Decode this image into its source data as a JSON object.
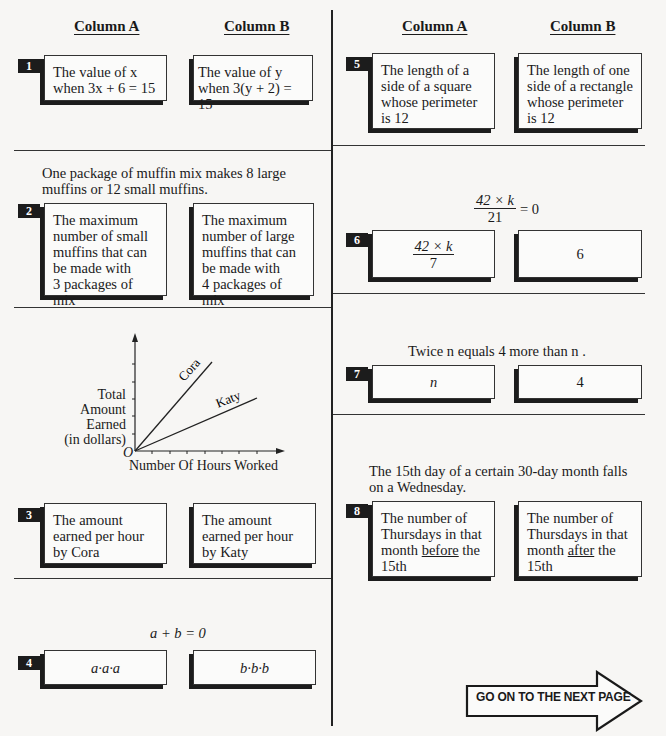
{
  "headers": {
    "left": {
      "column_a": "Column A",
      "column_b": "Column B"
    },
    "right": {
      "column_a": "Column A",
      "column_b": "Column B"
    }
  },
  "questions": [
    {
      "number": "1",
      "column_a": [
        "The value of x",
        "when 3x + 6 = 15"
      ],
      "column_b": [
        "The value of y",
        "when 3(y + 2) = 15"
      ]
    },
    {
      "number": "2",
      "stem": [
        "One package of muffin mix makes 8 large",
        "muffins or 12 small muffins."
      ],
      "column_a": [
        "The maximum",
        "number of small",
        "muffins that can",
        "be made with",
        "3 packages of mix"
      ],
      "column_b": [
        "The maximum",
        "number of large",
        "muffins that can",
        "be made with",
        "4 packages of mix"
      ]
    },
    {
      "number": "3",
      "figure": {
        "y_label": [
          "Total",
          "Amount",
          "Earned",
          "(in dollars)"
        ],
        "x_label": "Number Of Hours Worked",
        "origin": "O",
        "lines": [
          {
            "name": "Cora",
            "slope": "steeper"
          },
          {
            "name": "Katy",
            "slope": "shallower"
          }
        ]
      },
      "column_a": [
        "The amount",
        "earned per hour",
        "by Cora"
      ],
      "column_b": [
        "The amount",
        "earned per hour",
        "by Katy"
      ]
    },
    {
      "number": "4",
      "stem": "a + b = 0",
      "column_a": "a·a·a",
      "column_b": "b·b·b"
    },
    {
      "number": "5",
      "column_a": [
        "The length of a",
        "side of a square",
        "whose perimeter",
        "is 12"
      ],
      "column_b": [
        "The length of one",
        "side of a rectangle",
        "whose perimeter",
        "is 12"
      ]
    },
    {
      "number": "6",
      "stem": {
        "numerator": "42 × k",
        "denominator": "21",
        "rhs": "= 0"
      },
      "column_a": {
        "numerator": "42 × k",
        "denominator": "7"
      },
      "column_b": "6"
    },
    {
      "number": "7",
      "stem": "Twice n equals 4 more than n .",
      "column_a": "n",
      "column_b": "4"
    },
    {
      "number": "8",
      "stem": [
        "The 15th day of a certain 30-day month falls",
        "on a Wednesday."
      ],
      "column_a": {
        "l1": "The number of",
        "l2": "Thursdays in that",
        "l3_pre": "month ",
        "l3_u": "before",
        "l3_post": " the",
        "l4": "15th"
      },
      "column_b": {
        "l1": "The number of",
        "l2": "Thursdays in that",
        "l3_pre": "month ",
        "l3_u": "after",
        "l3_post": " the",
        "l4": "15th"
      }
    }
  ],
  "footer": {
    "next_page_label": "GO ON TO THE NEXT PAGE",
    "icon": "right-arrow-icon"
  }
}
